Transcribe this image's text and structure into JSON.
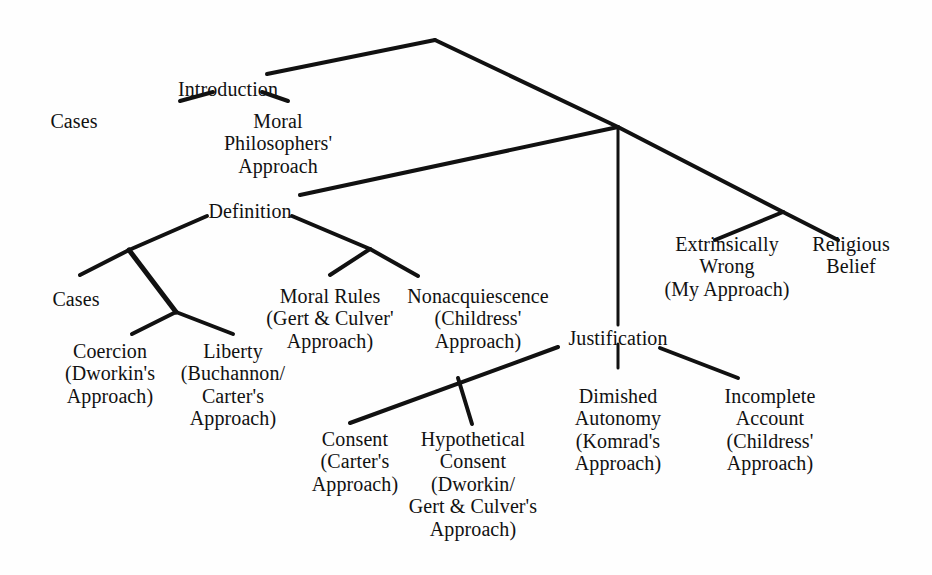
{
  "document": {
    "type": "hierarchical-tree-diagram",
    "title": "Thesis Outline Tree",
    "background_color": "#fefefe",
    "line_color": "#111111",
    "text_color": "#111111"
  },
  "tree": {
    "root": {
      "id": "root",
      "label": "",
      "apex": [
        435,
        40
      ]
    },
    "nodes": [
      {
        "id": "introduction",
        "lines": [
          "Introduction"
        ],
        "x": 228,
        "y": 78,
        "depth": 1
      },
      {
        "id": "intro-cases",
        "lines": [
          "Cases"
        ],
        "x": 74,
        "y": 110,
        "depth": 2
      },
      {
        "id": "moral-philosophers-approach",
        "lines": [
          "Moral",
          "Philosophers'",
          "Approach"
        ],
        "x": 278,
        "y": 110,
        "depth": 2
      },
      {
        "id": "definition",
        "lines": [
          "Definition"
        ],
        "x": 250,
        "y": 200,
        "depth": 1
      },
      {
        "id": "def-cases",
        "lines": [
          "Cases"
        ],
        "x": 76,
        "y": 288,
        "depth": 2
      },
      {
        "id": "coercion",
        "lines": [
          "Coercion",
          "(Dworkin's",
          "Approach)"
        ],
        "x": 110,
        "y": 340,
        "depth": 3
      },
      {
        "id": "liberty",
        "lines": [
          "Liberty",
          "(Buchannon/",
          "Carter's",
          "Approach)"
        ],
        "x": 233,
        "y": 340,
        "depth": 3
      },
      {
        "id": "moral-rules",
        "lines": [
          "Moral Rules",
          "(Gert & Culver'",
          "Approach)"
        ],
        "x": 330,
        "y": 285,
        "depth": 2
      },
      {
        "id": "nonacquiescence",
        "lines": [
          "Nonacquiescence",
          "(Childress'",
          "Approach)"
        ],
        "x": 478,
        "y": 285,
        "depth": 2
      },
      {
        "id": "justification",
        "lines": [
          "Justification"
        ],
        "x": 618,
        "y": 327,
        "depth": 1
      },
      {
        "id": "consent",
        "lines": [
          "Consent",
          "(Carter's",
          "Approach)"
        ],
        "x": 355,
        "y": 428,
        "depth": 2
      },
      {
        "id": "hypothetical-consent",
        "lines": [
          "Hypothetical",
          "Consent",
          "(Dworkin/",
          "Gert & Culver's",
          "Approach)"
        ],
        "x": 473,
        "y": 428,
        "depth": 2
      },
      {
        "id": "dimished-autonomy",
        "lines": [
          "Dimished",
          "Autonomy",
          "(Komrad's",
          "Approach)"
        ],
        "x": 618,
        "y": 385,
        "depth": 2
      },
      {
        "id": "incomplete-account",
        "lines": [
          "Incomplete",
          "Account",
          "(Childress'",
          "Approach)"
        ],
        "x": 770,
        "y": 385,
        "depth": 2
      },
      {
        "id": "extrinsically-wrong",
        "lines": [
          "Extrinsically",
          "Wrong",
          "(My Approach)"
        ],
        "x": 727,
        "y": 233,
        "depth": 1
      },
      {
        "id": "religious-belief",
        "lines": [
          "Religious",
          "Belief"
        ],
        "x": 851,
        "y": 233,
        "depth": 1
      }
    ],
    "edges": [
      {
        "id": "root-to-introduction",
        "points": [
          [
            435,
            40
          ],
          [
            267,
            74
          ]
        ],
        "width": 4
      },
      {
        "id": "root-to-junction",
        "points": [
          [
            435,
            40
          ],
          [
            618,
            127
          ]
        ],
        "width": 4
      },
      {
        "id": "introduction-to-cases",
        "points": [
          [
            213,
            92
          ],
          [
            180,
            101
          ]
        ],
        "width": 4
      },
      {
        "id": "introduction-to-moral-philosophers",
        "points": [
          [
            262,
            92
          ],
          [
            288,
            101
          ]
        ],
        "width": 4
      },
      {
        "id": "junction-to-definition",
        "points": [
          [
            618,
            127
          ],
          [
            300,
            195
          ]
        ],
        "width": 4
      },
      {
        "id": "junction-to-justification",
        "points": [
          [
            618,
            127
          ],
          [
            618,
            325
          ]
        ],
        "width": 3
      },
      {
        "id": "junction-to-right-split",
        "points": [
          [
            618,
            127
          ],
          [
            783,
            212
          ]
        ],
        "width": 4
      },
      {
        "id": "right-split-to-extrinsically-wrong",
        "points": [
          [
            783,
            212
          ],
          [
            715,
            240
          ]
        ],
        "width": 4
      },
      {
        "id": "right-split-to-religious-belief",
        "points": [
          [
            783,
            212
          ],
          [
            838,
            240
          ]
        ],
        "width": 4
      },
      {
        "id": "definition-to-left-fork",
        "points": [
          [
            207,
            216
          ],
          [
            129,
            250
          ]
        ],
        "width": 4
      },
      {
        "id": "left-fork-to-cases",
        "points": [
          [
            129,
            250
          ],
          [
            80,
            275
          ]
        ],
        "width": 4
      },
      {
        "id": "left-fork-to-mid-fork",
        "points": [
          [
            129,
            250
          ],
          [
            176,
            312
          ]
        ],
        "width": 5
      },
      {
        "id": "mid-fork-to-coercion",
        "points": [
          [
            176,
            312
          ],
          [
            132,
            334
          ]
        ],
        "width": 4
      },
      {
        "id": "mid-fork-to-liberty",
        "points": [
          [
            176,
            312
          ],
          [
            233,
            334
          ]
        ],
        "width": 4
      },
      {
        "id": "definition-to-right-fork",
        "points": [
          [
            292,
            216
          ],
          [
            370,
            249
          ]
        ],
        "width": 4
      },
      {
        "id": "right-fork-to-moral-rules",
        "points": [
          [
            370,
            249
          ],
          [
            330,
            275
          ]
        ],
        "width": 4
      },
      {
        "id": "right-fork-to-nonacquiescence",
        "points": [
          [
            370,
            249
          ],
          [
            418,
            276
          ]
        ],
        "width": 4
      },
      {
        "id": "justification-to-consent",
        "points": [
          [
            558,
            347
          ],
          [
            350,
            423
          ]
        ],
        "width": 4
      },
      {
        "id": "consent-fork-to-hypothetical",
        "points": [
          [
            458,
            378
          ],
          [
            472,
            424
          ]
        ],
        "width": 4
      },
      {
        "id": "justification-to-dimished-autonomy",
        "points": [
          [
            618,
            344
          ],
          [
            618,
            368
          ]
        ],
        "width": 3
      },
      {
        "id": "justification-to-incomplete-account",
        "points": [
          [
            660,
            348
          ],
          [
            738,
            378
          ]
        ],
        "width": 4
      }
    ]
  }
}
